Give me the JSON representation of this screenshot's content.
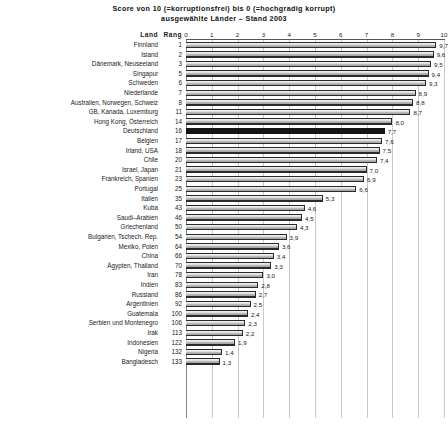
{
  "chart_data": {
    "type": "bar",
    "orientation": "horizontal",
    "title": "Score von 10 (=korruptionsfrei) bis 0 (=hochgradig korrupt)",
    "subtitle": "ausgewählte Länder – Stand 2003",
    "xlabel": "",
    "ylabel": "",
    "xlim": [
      0,
      10
    ],
    "xticks": [
      0,
      1,
      2,
      3,
      4,
      5,
      6,
      7,
      8,
      9,
      10
    ],
    "grid": true,
    "legend": null,
    "column_headers": {
      "country": "Land",
      "rank": "Rang"
    },
    "categories": [
      "Finnland",
      "Island",
      "Dänemark, Neuseeland",
      "Singapur",
      "Schweden",
      "Niederlande",
      "Australien, Norwegen, Schweiz",
      "GB, Kanada, Luxemburg",
      "Hong Kong, Österreich",
      "Deutschland",
      "Belgien",
      "Irland, USA",
      "Chile",
      "Israel, Japan",
      "Frankreich, Spanien",
      "Portugal",
      "Italien",
      "Kuba",
      "Saudi–Arabien",
      "Griechenland",
      "Bulgarien, Tschech. Rep.",
      "Mexiko, Polen",
      "China",
      "Ägypten, Thailand",
      "Iran",
      "Indien",
      "Russland",
      "Argentinien",
      "Guatemala",
      "Serbien und Montenegro",
      "Irak",
      "Indonesien",
      "Nigeria",
      "Bangladesch"
    ],
    "ranks": [
      "1",
      "2",
      "3",
      "5",
      "6",
      "7",
      "8",
      "11",
      "14",
      "16",
      "17",
      "18",
      "20",
      "21",
      "23",
      "25",
      "35",
      "43",
      "46",
      "50",
      "54",
      "64",
      "66",
      "70",
      "78",
      "83",
      "86",
      "92",
      "100",
      "106",
      "113",
      "122",
      "132",
      "133"
    ],
    "values": [
      9.7,
      9.6,
      9.5,
      9.4,
      9.3,
      8.9,
      8.8,
      8.7,
      8.0,
      7.7,
      7.6,
      7.5,
      7.4,
      7.0,
      6.9,
      6.6,
      5.3,
      4.6,
      4.5,
      4.3,
      3.9,
      3.6,
      3.4,
      3.3,
      3.0,
      2.8,
      2.7,
      2.5,
      2.4,
      2.3,
      2.2,
      1.9,
      1.4,
      1.3
    ],
    "value_labels": [
      "9,7",
      "9,6",
      "9,5",
      "9,4",
      "9,3",
      "8,9",
      "8,8",
      "8,7",
      "8,0",
      "7,7",
      "7,6",
      "7,5",
      "7,4",
      "7,0",
      "6,9",
      "6,6",
      "5,3",
      "4,6",
      "4,5",
      "4,3",
      "3,9",
      "3,6",
      "3,4",
      "3,3",
      "3,0",
      "2,8",
      "2,7",
      "2,5",
      "2,4",
      "2,3",
      "2,2",
      "1,9",
      "1,4",
      "1,3"
    ],
    "highlighted_index": 9,
    "colors": {
      "bar_fill": "#d6d6d6",
      "bar_edge": "#2b2b2b",
      "highlight_fill": "#151515",
      "gridline": "#c9c9c9",
      "background": "#ffffff",
      "text": "#1a1a1a"
    }
  }
}
